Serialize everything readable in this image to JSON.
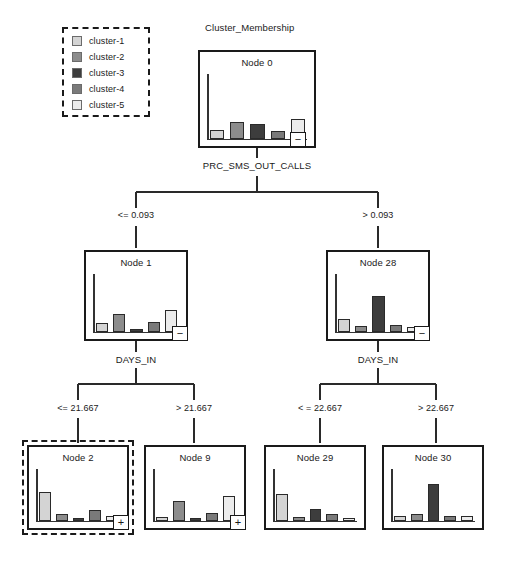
{
  "chart_title": "Cluster_Membership",
  "legend": {
    "items": [
      {
        "label": "cluster-1",
        "color": "#d4d4d4"
      },
      {
        "label": "cluster-2",
        "color": "#8c8c8c"
      },
      {
        "label": "cluster-3",
        "color": "#3d3d3d"
      },
      {
        "label": "cluster-4",
        "color": "#7a7a7a"
      },
      {
        "label": "cluster-5",
        "color": "#ececec"
      }
    ]
  },
  "chart_data": {
    "type": "bar",
    "title": "Cluster_Membership",
    "xlabel": "",
    "ylabel": "",
    "ylim": [
      0,
      100
    ],
    "categories": [
      "cluster-1",
      "cluster-2",
      "cluster-3",
      "cluster-4",
      "cluster-5"
    ],
    "colors": [
      "#d4d4d4",
      "#8c8c8c",
      "#3d3d3d",
      "#7a7a7a",
      "#ececec"
    ],
    "panels": [
      {
        "node": "Node 0",
        "values": [
          13,
          26,
          22,
          12,
          30
        ]
      },
      {
        "node": "Node 1",
        "values": [
          14,
          30,
          4,
          16,
          38
        ]
      },
      {
        "node": "Node 28",
        "values": [
          22,
          10,
          62,
          12,
          7
        ]
      },
      {
        "node": "Node 2",
        "values": [
          55,
          12,
          4,
          20,
          9
        ]
      },
      {
        "node": "Node 9",
        "values": [
          7,
          38,
          5,
          14,
          48
        ]
      },
      {
        "node": "Node 29",
        "values": [
          52,
          7,
          23,
          13,
          3
        ]
      },
      {
        "node": "Node 30",
        "values": [
          8,
          13,
          70,
          9,
          9
        ]
      }
    ]
  },
  "tree": {
    "root_split": "PRC_SMS_OUT_CALLS",
    "level2_split_left": "DAYS_IN",
    "level2_split_right": "DAYS_IN",
    "branches": {
      "root_left": "<= 0.093",
      "root_right": "> 0.093",
      "left_left": "<= 21.667",
      "left_right": "> 21.667",
      "right_left": "< = 22.667",
      "right_right": "> 22.667"
    },
    "nodes": [
      {
        "id": "node0",
        "title": "Node 0",
        "nub": "−",
        "selected": false
      },
      {
        "id": "node1",
        "title": "Node 1",
        "nub": "−",
        "selected": false
      },
      {
        "id": "node28",
        "title": "Node 28",
        "nub": "−",
        "selected": false
      },
      {
        "id": "node2",
        "title": "Node 2",
        "nub": "+",
        "selected": true
      },
      {
        "id": "node9",
        "title": "Node 9",
        "nub": "+",
        "selected": false
      },
      {
        "id": "node29",
        "title": "Node 29",
        "nub": "",
        "selected": false
      },
      {
        "id": "node30",
        "title": "Node 30",
        "nub": "",
        "selected": false
      }
    ]
  }
}
